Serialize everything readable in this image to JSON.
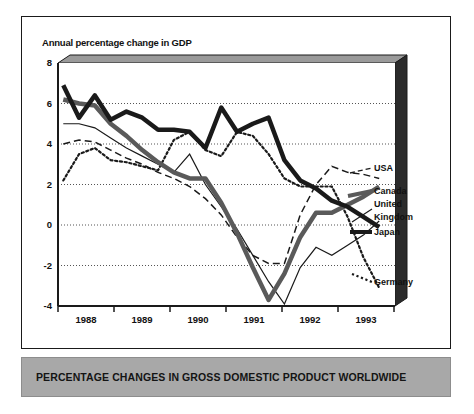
{
  "figure": {
    "title": "Annual percentage change in GDP",
    "caption": "PERCENTAGE CHANGES IN GROSS DOMESTIC PRODUCT WORLDWIDE"
  },
  "axes": {
    "y_ticks": [
      "8",
      "6",
      "4",
      "2",
      "0",
      "-2",
      "-4"
    ],
    "x_ticks": [
      "1988",
      "1989",
      "1990",
      "1991",
      "1992",
      "1993"
    ]
  },
  "legend": {
    "usa": "USA",
    "canada": "Canada",
    "uk_line1": "United",
    "uk_line2": "Kingdom",
    "japan": "Japan",
    "germany": "Germany"
  },
  "colors": {
    "frame": "#1a1a1a",
    "plot_background": "#ffffff",
    "caption_background": "#a8a8a8",
    "japan_line": "#1a1a1a",
    "canada_line": "#5a5a5a",
    "uk_line": "#1a1a1a",
    "usa_line": "#1a1a1a",
    "germany_line": "#1a1a1a",
    "grid": "#666666"
  },
  "chart_data": {
    "type": "line",
    "title": "Annual percentage change in GDP",
    "xlabel": "",
    "ylabel": "Annual percentage change in GDP",
    "ylim": [
      -4,
      8
    ],
    "xlim": [
      1987.5,
      1993.9
    ],
    "grid": true,
    "grid_values": [
      6,
      4,
      2,
      0,
      -2
    ],
    "legend_position": "right-outside",
    "x_tick_labels": [
      "1988",
      "1989",
      "1990",
      "1991",
      "1992",
      "1993"
    ],
    "y_tick_labels": [
      "8",
      "6",
      "4",
      "2",
      "0",
      "-2",
      "-4"
    ],
    "series": [
      {
        "name": "Japan",
        "style": "thick-solid-black",
        "color": "#1a1a1a",
        "x": [
          1987.6,
          1987.9,
          1988.2,
          1988.5,
          1988.8,
          1989.1,
          1989.4,
          1989.7,
          1990.0,
          1990.3,
          1990.6,
          1990.9,
          1991.2,
          1991.5,
          1991.8,
          1992.1,
          1992.4,
          1992.7,
          1993.0,
          1993.3,
          1993.6
        ],
        "y": [
          6.9,
          5.3,
          6.4,
          5.2,
          5.6,
          5.3,
          4.7,
          4.7,
          4.6,
          3.8,
          5.8,
          4.6,
          5.0,
          5.3,
          3.2,
          2.2,
          1.8,
          1.2,
          0.9,
          0.4,
          -0.1
        ]
      },
      {
        "name": "Canada",
        "style": "thick-solid-gray",
        "color": "#5a5a5a",
        "x": [
          1987.6,
          1987.9,
          1988.2,
          1988.5,
          1988.8,
          1989.1,
          1989.4,
          1989.7,
          1990.0,
          1990.3,
          1990.6,
          1990.9,
          1991.2,
          1991.5,
          1991.8,
          1992.1,
          1992.4,
          1992.7,
          1993.0,
          1993.3,
          1993.6
        ],
        "y": [
          6.2,
          6.0,
          5.9,
          5.0,
          4.4,
          3.7,
          3.1,
          2.6,
          2.3,
          2.3,
          1.1,
          -0.4,
          -2.1,
          -3.7,
          -2.4,
          -0.6,
          0.6,
          0.6,
          1.0,
          1.4,
          1.9
        ]
      },
      {
        "name": "United Kingdom",
        "style": "thin-solid-black",
        "color": "#1a1a1a",
        "x": [
          1987.6,
          1987.9,
          1988.2,
          1988.5,
          1988.8,
          1989.1,
          1989.4,
          1989.7,
          1990.0,
          1990.3,
          1990.6,
          1990.9,
          1991.2,
          1991.5,
          1991.8,
          1992.1,
          1992.4,
          1992.7,
          1993.0,
          1993.3,
          1993.6
        ],
        "y": [
          5.0,
          5.0,
          4.8,
          4.3,
          3.8,
          3.4,
          3.0,
          2.6,
          3.5,
          2.0,
          0.9,
          -0.2,
          -1.5,
          -2.8,
          -3.9,
          -2.1,
          -1.1,
          -1.5,
          -1.0,
          -0.5,
          0.2
        ]
      },
      {
        "name": "USA",
        "style": "dashed-black",
        "color": "#1a1a1a",
        "x": [
          1987.6,
          1987.9,
          1988.2,
          1988.5,
          1988.8,
          1989.1,
          1989.4,
          1989.7,
          1990.0,
          1990.3,
          1990.6,
          1990.9,
          1991.2,
          1991.5,
          1991.8,
          1992.1,
          1992.4,
          1992.7,
          1993.0,
          1993.3,
          1993.6
        ],
        "y": [
          4.0,
          4.2,
          4.1,
          3.7,
          3.3,
          3.0,
          2.6,
          2.3,
          1.9,
          1.3,
          0.5,
          -0.6,
          -1.5,
          -1.9,
          -1.9,
          0.5,
          2.0,
          2.9,
          2.6,
          2.5,
          2.3
        ]
      },
      {
        "name": "Germany",
        "style": "dotted-black",
        "color": "#1a1a1a",
        "x": [
          1987.6,
          1987.9,
          1988.2,
          1988.5,
          1988.8,
          1989.1,
          1989.4,
          1989.7,
          1990.0,
          1990.3,
          1990.6,
          1990.9,
          1991.2,
          1991.5,
          1991.8,
          1992.1,
          1992.4,
          1992.7,
          1993.0,
          1993.3,
          1993.6
        ],
        "y": [
          2.2,
          3.5,
          3.8,
          3.2,
          3.1,
          2.9,
          2.7,
          4.2,
          4.6,
          3.7,
          3.4,
          4.6,
          4.4,
          3.5,
          2.3,
          1.9,
          1.9,
          1.9,
          0.4,
          -1.6,
          -3.1
        ]
      }
    ]
  }
}
